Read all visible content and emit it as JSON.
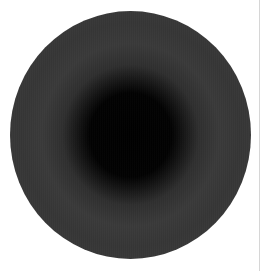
{
  "image": {
    "caption_fragment": "",
    "subject": "dark circular disc with radial ring gradient",
    "colors": {
      "background": "#ffffff",
      "disc_center": "#000000",
      "disc_midband": "#3a3a3a",
      "disc_edge": "#0e0e0e",
      "right_rule": "#d6d6d6"
    }
  }
}
